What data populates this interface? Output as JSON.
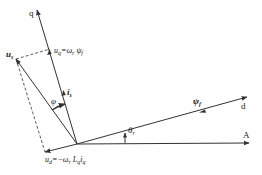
{
  "diagram": {
    "type": "phasor-diagram",
    "axes": {
      "q": {
        "label": "q"
      },
      "d": {
        "label": "d"
      },
      "A": {
        "label": "A"
      }
    },
    "vectors": {
      "us": {
        "label": "u",
        "sub": "s"
      },
      "is": {
        "label": "i",
        "sub": "s"
      },
      "psi_f": {
        "label": "ψ",
        "sub": "f"
      },
      "uq": {
        "label": "u",
        "sub": "q",
        "eq": "=ω",
        "eq_sub": "r",
        "rhs": " ψ",
        "rhs_sub": "f"
      },
      "ud": {
        "label": "u",
        "sub": "d",
        "eq": "=−ω",
        "eq_sub": "r",
        "rhs": " L",
        "rhs_sub": "q",
        "rhs2": "i",
        "rhs2_sub": "q"
      }
    },
    "angles": {
      "phi": {
        "label": "φ"
      },
      "theta_r": {
        "label": "θ",
        "sub": "r"
      }
    },
    "colors": {
      "line": "#333333",
      "background": "#ffffff"
    }
  }
}
